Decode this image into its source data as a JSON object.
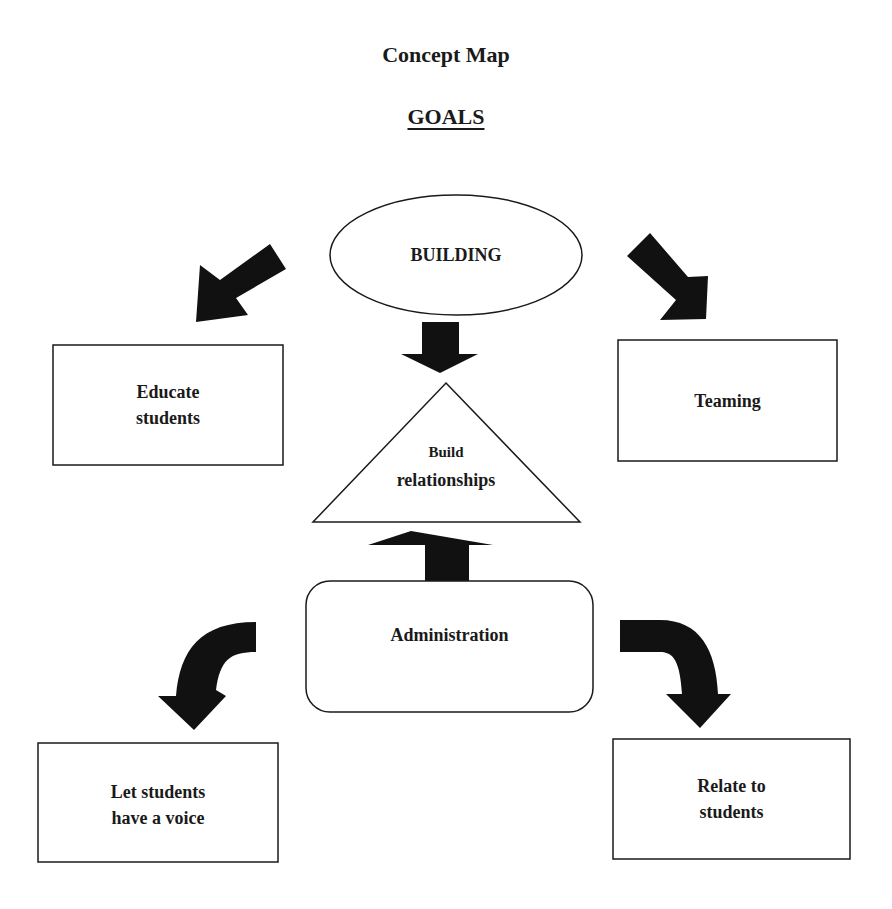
{
  "title": "Concept Map",
  "subtitle": "GOALS",
  "nodes": {
    "building": {
      "label": "BUILDING",
      "shape": "ellipse"
    },
    "educate": {
      "label": "Educate students",
      "lines": [
        "Educate",
        "students"
      ],
      "shape": "rectangle"
    },
    "teaming": {
      "label": "Teaming",
      "shape": "rectangle"
    },
    "build_relationships": {
      "label": "Build relationships",
      "lines": [
        "Build",
        "relationships"
      ],
      "shape": "triangle"
    },
    "administration": {
      "label": "Administration",
      "shape": "rounded-rectangle"
    },
    "voice": {
      "label": "Let students have a voice",
      "lines": [
        "Let students",
        "have a voice"
      ],
      "shape": "rectangle"
    },
    "relate": {
      "label": "Relate to students",
      "lines": [
        "Relate to",
        "students"
      ],
      "shape": "rectangle"
    }
  },
  "edges": [
    {
      "from": "BUILDING",
      "to": "Educate students",
      "style": "block-arrow"
    },
    {
      "from": "BUILDING",
      "to": "Teaming",
      "style": "block-arrow"
    },
    {
      "from": "BUILDING",
      "to": "Build relationships",
      "style": "block-arrow"
    },
    {
      "from": "Administration",
      "to": "Build relationships",
      "style": "block-arrow"
    },
    {
      "from": "Administration",
      "to": "Let students have a voice",
      "style": "curved-block-arrow"
    },
    {
      "from": "Administration",
      "to": "Relate to students",
      "style": "curved-block-arrow"
    }
  ],
  "colors": {
    "stroke": "#1a1a1a",
    "fill": "#ffffff",
    "arrow": "#111111"
  }
}
